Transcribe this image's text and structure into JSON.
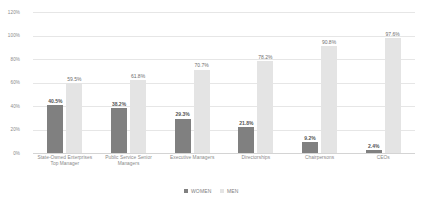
{
  "chart_data": {
    "type": "bar",
    "title": "",
    "subtitle": "",
    "xlabel": "",
    "ylabel": "",
    "ylim": [
      0,
      120
    ],
    "y_ticks": [
      "0%",
      "20%",
      "40%",
      "60%",
      "80%",
      "100%",
      "120%"
    ],
    "grid": true,
    "legend_position": "bottom",
    "categories": [
      "State-Owned Enterprises Top Manager",
      "Public Service Senior Managers",
      "Executive Managers",
      "Directorships",
      "Chairpersons",
      "CEOs"
    ],
    "series": [
      {
        "name": "WOMEN",
        "color": "#808080",
        "values": [
          40.5,
          38.2,
          29.3,
          21.8,
          9.2,
          2.4
        ],
        "labels": [
          "40.5%",
          "38.2%",
          "29.3%",
          "21.8%",
          "9.2%",
          "2.4%"
        ]
      },
      {
        "name": "MEN",
        "color": "#e4e4e4",
        "values": [
          59.5,
          61.8,
          70.7,
          78.2,
          90.8,
          97.6
        ],
        "labels": [
          "59.5%",
          "61.8%",
          "70.7%",
          "78.2%",
          "90.8%",
          "97.6%"
        ]
      }
    ]
  },
  "axis": {
    "y_ticks": [
      {
        "label": "120%",
        "value": 120
      },
      {
        "label": "100%",
        "value": 100
      },
      {
        "label": "80%",
        "value": 80
      },
      {
        "label": "60%",
        "value": 60
      },
      {
        "label": "40%",
        "value": 40
      },
      {
        "label": "20%",
        "value": 20
      },
      {
        "label": "0%",
        "value": 0
      }
    ]
  },
  "legend": {
    "items": [
      {
        "label": "WOMEN",
        "color": "#808080"
      },
      {
        "label": "MEN",
        "color": "#e4e4e4"
      }
    ]
  },
  "colors": {
    "women": "#808080",
    "men": "#e4e4e4",
    "gridline": "#e6e6e6",
    "text": "#8a8a8a",
    "background": "#ffffff"
  }
}
